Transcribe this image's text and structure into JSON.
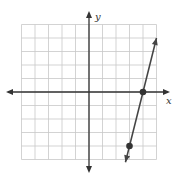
{
  "chart_data": {
    "type": "line",
    "title": "",
    "xlabel": "x",
    "ylabel": "y",
    "xlim": [
      -5,
      5
    ],
    "ylim": [
      -5,
      5
    ],
    "grid": true,
    "grid_step": 1,
    "tick_labels": false,
    "series": [
      {
        "name": "line",
        "points": [
          {
            "x": 3,
            "y": -4
          },
          {
            "x": 4,
            "y": 0
          }
        ],
        "slope": 4,
        "y_intercept": -16,
        "equation": "y = 4x - 16",
        "arrows_both_ends": true
      }
    ],
    "marked_points": [
      {
        "x": 4,
        "y": 0,
        "label": ""
      },
      {
        "x": 3,
        "y": -4,
        "label": ""
      }
    ]
  },
  "axes": {
    "x_label": "x",
    "y_label": "y"
  },
  "colors": {
    "grid": "#c8c8c8",
    "axis": "#333333",
    "line": "#444444",
    "point": "#333333"
  }
}
